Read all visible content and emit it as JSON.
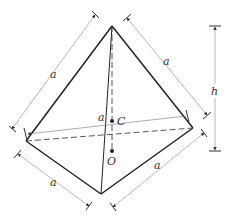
{
  "diagram": {
    "vertices": {
      "apex": [
        112,
        26
      ],
      "left": [
        26,
        141
      ],
      "right": [
        193,
        128
      ],
      "bottom": [
        101,
        194
      ]
    },
    "points": {
      "C": {
        "label": "C",
        "pos": [
          112,
          121
        ]
      },
      "O": {
        "label": "O",
        "pos": [
          112,
          151
        ]
      }
    },
    "labels": {
      "edge_upper_left": "a",
      "edge_upper_right": "a",
      "edge_middle": "a",
      "edge_lower_left": "a",
      "edge_lower_right": "a",
      "height": "h",
      "centroid": "C",
      "base_center": "O"
    },
    "colors": {
      "edge": "#222222",
      "dimension": "#999999",
      "background": "#ffffff"
    }
  }
}
